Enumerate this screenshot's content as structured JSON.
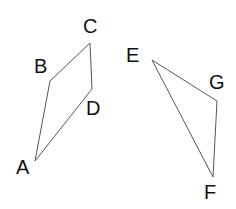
{
  "shapes": {
    "quadrilateral": {
      "points": {
        "A": [
          35,
          161
        ],
        "B": [
          50,
          81
        ],
        "C": [
          90,
          43
        ],
        "D": [
          92,
          89
        ]
      },
      "order": [
        "A",
        "B",
        "C",
        "D"
      ]
    },
    "triangle": {
      "points": {
        "E": [
          152,
          60
        ],
        "G": [
          217,
          101
        ],
        "F": [
          213,
          177
        ]
      },
      "order": [
        "E",
        "G",
        "F"
      ]
    }
  },
  "labels": {
    "A": "A",
    "B": "B",
    "C": "C",
    "D": "D",
    "E": "E",
    "F": "F",
    "G": "G"
  },
  "colors": {
    "stroke": "#555555",
    "text": "#111111",
    "background": "#ffffff"
  }
}
